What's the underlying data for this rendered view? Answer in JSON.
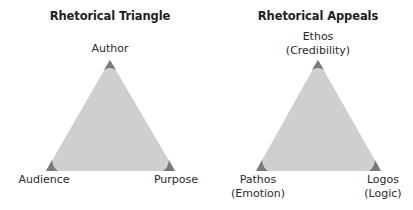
{
  "colors": {
    "triangle_fill": "#cfcfcf",
    "corner_fill": "#7a7a7a",
    "text": "#2a2a2a",
    "background": "#ffffff"
  },
  "diagrams": [
    {
      "title": "Rhetorical Triangle",
      "vertices": {
        "top": {
          "label_lines": [
            "Author"
          ]
        },
        "bottom_left": {
          "label_lines": [
            "Audience"
          ]
        },
        "bottom_right": {
          "label_lines": [
            "Purpose"
          ]
        }
      }
    },
    {
      "title": "Rhetorical Appeals",
      "vertices": {
        "top": {
          "label_lines": [
            "Ethos",
            "(Credibility)"
          ]
        },
        "bottom_left": {
          "label_lines": [
            "Pathos",
            "(Emotion)"
          ]
        },
        "bottom_right": {
          "label_lines": [
            "Logos",
            "(Logic)"
          ]
        }
      }
    }
  ]
}
